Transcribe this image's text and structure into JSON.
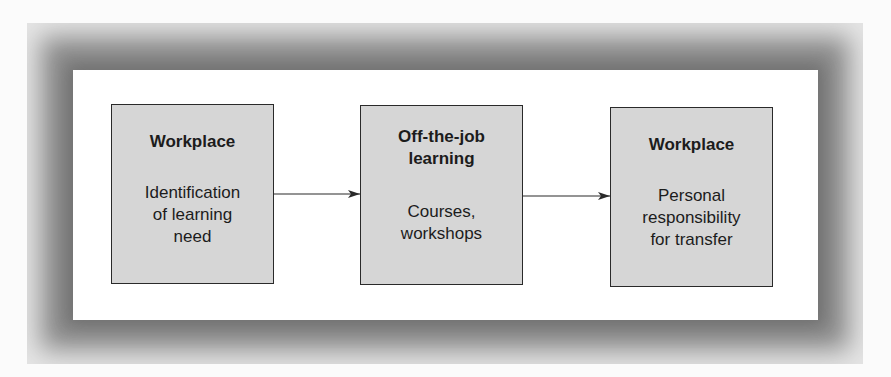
{
  "diagram": {
    "type": "flowchart",
    "boxes": [
      {
        "title": "Workplace",
        "description": "Identification of learning need"
      },
      {
        "title": "Off-the-job learning",
        "description": "Courses, workshops"
      },
      {
        "title": "Workplace",
        "description": "Personal responsibility for transfer"
      }
    ],
    "connections": [
      {
        "from": 0,
        "to": 1
      },
      {
        "from": 1,
        "to": 2
      }
    ],
    "colors": {
      "box_fill": "#d6d6d6",
      "box_border": "#2a2a2a",
      "frame": "#8a8a8a",
      "panel": "#ffffff"
    }
  }
}
